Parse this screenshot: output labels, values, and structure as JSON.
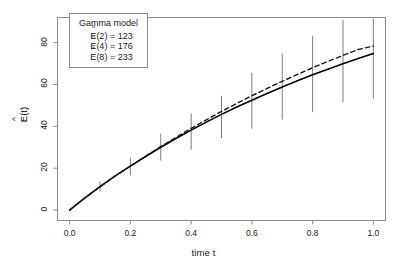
{
  "chart_data": {
    "type": "line",
    "title": "",
    "xlabel": "time t",
    "ylabel": "Ê(t)",
    "xlim": [
      -0.04,
      1.04
    ],
    "ylim": [
      -5,
      92
    ],
    "grid": false,
    "box": true,
    "xticks": [
      0.0,
      0.2,
      0.4,
      0.6,
      0.8,
      1.0
    ],
    "xtick_labels": [
      "0.0",
      "0.2",
      "0.4",
      "0.6",
      "0.8",
      "1.0"
    ],
    "yticks": [
      0,
      20,
      40,
      60,
      80
    ],
    "ytick_labels": [
      "0",
      "20",
      "40",
      "60",
      "80"
    ],
    "series": [
      {
        "name": "fitted-solid",
        "style": "solid",
        "color": "#000000",
        "width": 1.6,
        "x": [
          0.0,
          0.05,
          0.1,
          0.15,
          0.2,
          0.25,
          0.3,
          0.35,
          0.4,
          0.45,
          0.5,
          0.55,
          0.6,
          0.65,
          0.7,
          0.75,
          0.8,
          0.85,
          0.9,
          0.95,
          1.0
        ],
        "y": [
          0.0,
          5.8,
          11.2,
          16.3,
          21.0,
          25.6,
          30.0,
          34.2,
          38.2,
          42.0,
          45.7,
          49.2,
          52.5,
          55.7,
          58.8,
          61.8,
          64.6,
          67.3,
          69.9,
          72.4,
          74.8
        ]
      },
      {
        "name": "reference-dashed",
        "style": "dashed",
        "color": "#1a1a1a",
        "width": 1.4,
        "x": [
          0.0,
          0.05,
          0.1,
          0.15,
          0.2,
          0.25,
          0.3,
          0.35,
          0.4,
          0.45,
          0.5,
          0.55,
          0.6,
          0.65,
          0.7,
          0.75,
          0.8,
          0.85,
          0.9,
          0.95,
          1.0
        ],
        "y": [
          0.0,
          5.7,
          11.1,
          16.2,
          21.0,
          25.7,
          30.3,
          34.7,
          39.0,
          43.1,
          47.1,
          50.9,
          54.6,
          58.1,
          61.5,
          64.8,
          68.0,
          71.0,
          73.9,
          76.7,
          78.4
        ]
      }
    ],
    "error_bars": {
      "name": "pointwise-intervals",
      "color": "#6e6e6e",
      "width": 0.9,
      "x": [
        0.1,
        0.2,
        0.3,
        0.4,
        0.5,
        0.6,
        0.7,
        0.8,
        0.9,
        1.0
      ],
      "center": [
        11.2,
        21.0,
        30.0,
        38.2,
        45.7,
        52.5,
        58.8,
        64.6,
        69.9,
        74.8
      ],
      "lower": [
        8.9,
        16.6,
        23.6,
        28.8,
        34.4,
        38.8,
        43.2,
        46.8,
        51.5,
        53.0
      ],
      "upper": [
        13.6,
        25.0,
        36.5,
        46.2,
        54.6,
        65.6,
        74.8,
        83.2,
        90.8,
        91.5
      ]
    },
    "annotations": {
      "legend_box": {
        "title": "Gamma model",
        "entries": [
          {
            "label": "Ê(2)",
            "equals": "=",
            "value": "123"
          },
          {
            "label": "Ê(4)",
            "equals": "=",
            "value": "176"
          },
          {
            "label": "Ê(8)",
            "equals": "=",
            "value": "233"
          }
        ]
      }
    }
  },
  "legend": {
    "title": "Gamma model",
    "rows": [
      {
        "base": "E(2)",
        "text": "E(2) = 123"
      },
      {
        "base": "E(4)",
        "text": "E(4) = 176"
      },
      {
        "base": "E(8)",
        "text": "E(8) = 233"
      }
    ]
  },
  "axes": {
    "xlabel": "time t",
    "ylabel": "E(t)",
    "xtick_labels": [
      "0.0",
      "0.2",
      "0.4",
      "0.6",
      "0.8",
      "1.0"
    ],
    "ytick_labels": [
      "0",
      "20",
      "40",
      "60",
      "80"
    ]
  },
  "colors": {
    "curve": "#000000",
    "dashed": "#1a1a1a",
    "errorbar": "#6e6e6e",
    "box": "#8c8c8c",
    "background": "#ffffff"
  }
}
